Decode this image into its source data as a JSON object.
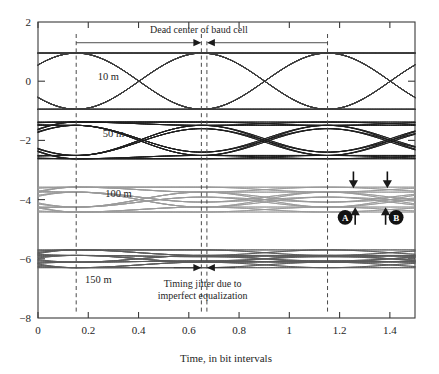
{
  "chart_data": {
    "type": "line",
    "title": "",
    "xlabel": "Time, in bit intervals",
    "ylabel": "",
    "xlim": [
      0,
      1.5
    ],
    "ylim": [
      -8,
      2
    ],
    "grid": false,
    "legend": "inline-annotations",
    "xticks": [
      0,
      0.2,
      0.4,
      0.6,
      0.8,
      1,
      1.2,
      1.4
    ],
    "xtick_labels": [
      "0",
      "0.2",
      "0.4",
      "0.6",
      "0.8",
      "1",
      "1.2",
      "1.4"
    ],
    "yticks": [
      2,
      0,
      -2,
      -4,
      -6,
      -8
    ],
    "ytick_labels": [
      "2",
      "0",
      "−2",
      "−4",
      "−6",
      "−8"
    ],
    "series": [
      {
        "name": "10 m",
        "label": "10 m",
        "offset": 0,
        "amplitude": 0.95,
        "color": "#3c3c3c",
        "linewidth": 0.9,
        "label_x": 0.28,
        "label_y": 0.05
      },
      {
        "name": "50 m",
        "label": "50 m",
        "offset": -2,
        "amplitude": 0.62,
        "color": "#1e1e1e",
        "linewidth": 1.0,
        "label_x": 0.3,
        "label_y": -1.9
      },
      {
        "name": "100 m",
        "label": "100 m",
        "offset": -4,
        "amplitude": 0.42,
        "color": "#9a9a9a",
        "linewidth": 0.9,
        "label_x": 0.32,
        "label_y": -3.92
      },
      {
        "name": "150 m",
        "label": "150 m",
        "offset": -6,
        "amplitude": 0.3,
        "color": "#5a5a5a",
        "linewidth": 0.9,
        "label_x": 0.24,
        "label_y": -6.82
      }
    ],
    "dashed_lines": [
      {
        "name": "baud-cell-left-edge",
        "x": 0.152
      },
      {
        "name": "baud-cell-center-early",
        "x": 0.65
      },
      {
        "name": "baud-cell-center-late",
        "x": 0.672
      },
      {
        "name": "baud-cell-right-edge",
        "x": 1.152
      }
    ],
    "annotations": [
      {
        "name": "dead-center-of-baud-cell",
        "text": "Dead center of baud cell",
        "x": 0.64,
        "y": 1.63
      },
      {
        "name": "timing-jitter",
        "line1": "Timing jitter due to",
        "line2": "imperfect equalization",
        "x": 0.655,
        "y": -6.95
      }
    ],
    "markers": [
      {
        "name": "marker-a",
        "letter": "A",
        "x": 1.222,
        "y": -4.6
      },
      {
        "name": "marker-b",
        "letter": "B",
        "x": 1.425,
        "y": -4.6
      }
    ],
    "marker_arrows": [
      {
        "name": "arrow-down-a",
        "x": 1.255,
        "direction": "down",
        "y_top": -3.05,
        "y_bottom": -3.62
      },
      {
        "name": "arrow-down-b",
        "x": 1.39,
        "direction": "down",
        "y_top": -3.05,
        "y_bottom": -3.62
      },
      {
        "name": "arrow-up-a",
        "x": 1.262,
        "direction": "up",
        "y_top": -4.26,
        "y_bottom": -4.85
      },
      {
        "name": "arrow-up-b",
        "x": 1.383,
        "direction": "up",
        "y_top": -4.26,
        "y_bottom": -4.85
      }
    ]
  },
  "figure": {
    "plot_left_px": 38,
    "plot_right_px": 415,
    "plot_top_px": 22,
    "plot_bottom_px": 318
  }
}
